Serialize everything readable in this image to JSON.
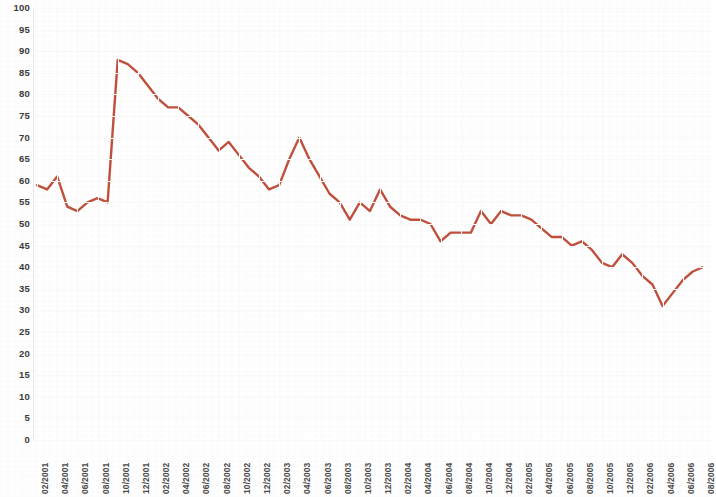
{
  "chart_data": {
    "type": "line",
    "title": "",
    "subtitle": "",
    "xlabel": "",
    "ylabel": "",
    "ylim": [
      0,
      100
    ],
    "ytick_step": 5,
    "yticks": [
      100,
      95,
      90,
      85,
      80,
      75,
      70,
      65,
      60,
      55,
      50,
      45,
      40,
      35,
      30,
      25,
      20,
      15,
      10,
      5,
      0
    ],
    "grid": true,
    "legend": null,
    "line_color": "#C0503C",
    "xtick_labels": [
      "02/2001",
      "04/2001",
      "06/2001",
      "08/2001",
      "10/2001",
      "12/2001",
      "02/2002",
      "04/2002",
      "06/2002",
      "08/2002",
      "10/2002",
      "12/2002",
      "02/2003",
      "04/2003",
      "06/2003",
      "08/2003",
      "10/2003",
      "12/2003",
      "02/2004",
      "04/2004",
      "06/2004",
      "08/2004",
      "10/2004",
      "12/2004",
      "02/2005",
      "04/2005",
      "06/2005",
      "08/2005",
      "10/2005",
      "12/2005",
      "02/2006",
      "04/2006",
      "06/2006",
      "08/2006"
    ],
    "x": [
      "02/2001",
      "03/2001",
      "04/2001",
      "05/2001",
      "06/2001",
      "07/2001",
      "08/2001",
      "09/2001",
      "10/2001",
      "11/2001",
      "12/2001",
      "01/2002",
      "02/2002",
      "03/2002",
      "04/2002",
      "05/2002",
      "06/2002",
      "07/2002",
      "08/2002",
      "09/2002",
      "10/2002",
      "11/2002",
      "12/2002",
      "01/2003",
      "02/2003",
      "03/2003",
      "04/2003",
      "05/2003",
      "06/2003",
      "07/2003",
      "08/2003",
      "09/2003",
      "10/2003",
      "11/2003",
      "12/2003",
      "01/2004",
      "02/2004",
      "03/2004",
      "04/2004",
      "05/2004",
      "06/2004",
      "07/2004",
      "08/2004",
      "09/2004",
      "10/2004",
      "11/2004",
      "12/2004",
      "01/2005",
      "02/2005",
      "03/2005",
      "04/2005",
      "05/2005",
      "06/2005",
      "07/2005",
      "08/2005",
      "09/2005",
      "10/2005",
      "11/2005",
      "12/2005",
      "01/2006",
      "02/2006",
      "03/2006",
      "04/2006",
      "05/2006",
      "06/2006",
      "07/2006",
      "08/2006"
    ],
    "values": [
      59,
      58,
      61,
      54,
      53,
      55,
      56,
      55,
      88,
      87,
      85,
      82,
      79,
      77,
      77,
      75,
      73,
      70,
      67,
      69,
      66,
      63,
      61,
      58,
      59,
      65,
      70,
      65,
      61,
      57,
      55,
      51,
      55,
      53,
      58,
      54,
      52,
      51,
      51,
      50,
      46,
      48,
      48,
      48,
      53,
      50,
      53,
      52,
      52,
      51,
      49,
      47,
      47,
      45,
      46,
      44,
      41,
      40,
      43,
      41,
      38,
      36,
      31,
      34,
      37,
      39,
      40
    ],
    "series": [
      {
        "name": "series-1",
        "color": "#C0503C",
        "values": [
          59,
          58,
          61,
          54,
          53,
          55,
          56,
          55,
          88,
          87,
          85,
          82,
          79,
          77,
          77,
          75,
          73,
          70,
          67,
          69,
          66,
          63,
          61,
          58,
          59,
          65,
          70,
          65,
          61,
          57,
          55,
          51,
          55,
          53,
          58,
          54,
          52,
          51,
          51,
          50,
          46,
          48,
          48,
          48,
          53,
          50,
          53,
          52,
          52,
          51,
          49,
          47,
          47,
          45,
          46,
          44,
          41,
          40,
          43,
          41,
          38,
          36,
          31,
          34,
          37,
          39,
          40
        ]
      }
    ],
    "annotations": [],
    "notes": {
      "peak_value": 88,
      "peak_x": "10/2001",
      "min_value": 31,
      "min_x": "04/2006",
      "start_value": 59,
      "end_value": 40
    }
  }
}
